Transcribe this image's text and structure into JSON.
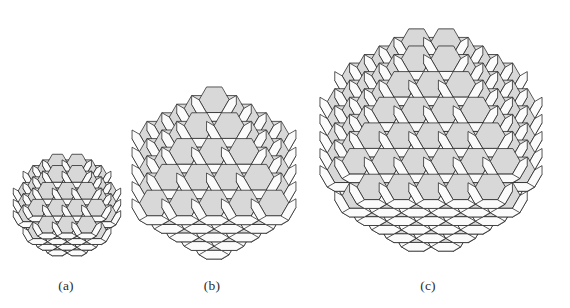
{
  "figure": {
    "background_color": "#ffffff",
    "width": 570,
    "height": 308,
    "caption_font_size": 13.5,
    "caption_baseline_y": 289
  },
  "style": {
    "stroke_color": "#1f1f1f",
    "stroke_width": 0.75,
    "face_white": "#fdfdfd",
    "face_light": "#f4f4f4",
    "face_shaded": "#d8d8d8",
    "face_shaded_dark": "#c9c9c9",
    "face_top": "#fbfbfb",
    "face_left": "#f0f0f0"
  },
  "projection": {
    "type": "isometric",
    "axis_a": [
      0.866,
      0.5
    ],
    "axis_b": [
      -0.866,
      0.5
    ],
    "axis_c": [
      0.0,
      -1.0
    ],
    "description": "Standard isometric view of a BCC lattice of truncated octahedra"
  },
  "panels": [
    {
      "id": "panel-a",
      "label": "(a)",
      "order": 1,
      "grid_n": 3,
      "cell_size": 17.5,
      "center_x": 66,
      "center_y": 205,
      "bounds": {
        "x": 12,
        "y": 148,
        "w": 110,
        "h": 114
      },
      "caption_x": 66
    },
    {
      "id": "panel-b",
      "label": "(b)",
      "order": 2,
      "grid_n": 4,
      "cell_size": 17.5,
      "center_x": 212,
      "center_y": 175,
      "bounds": {
        "x": 128,
        "y": 85,
        "w": 172,
        "h": 176
      },
      "caption_x": 212
    },
    {
      "id": "panel-c",
      "label": "(c)",
      "order": 3,
      "grid_n": 5,
      "cell_size": 17.5,
      "center_x": 428,
      "center_y": 142,
      "bounds": {
        "x": 318,
        "y": 20,
        "w": 226,
        "h": 240
      },
      "caption_x": 428
    }
  ],
  "cell": {
    "name": "truncated-octahedron",
    "faces_hexagonal": 8,
    "faces_square": 6,
    "vertices": 24,
    "edges": 36
  }
}
